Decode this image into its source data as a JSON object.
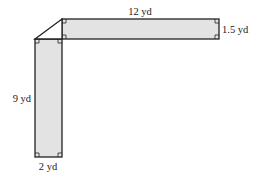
{
  "diagram": {
    "type": "L-shaped region composed of two rectangles joined by a triangle",
    "fill_color": "#e3e3e3",
    "stroke_color": "#222222",
    "labels": {
      "top_length": "12 yd",
      "right_width": "1.5 yd",
      "left_length": "9 yd",
      "bottom_width": "2 yd"
    },
    "shapes": {
      "horizontal_rect": {
        "width": "12 yd",
        "height": "1.5 yd"
      },
      "vertical_rect": {
        "width": "2 yd",
        "height": "9 yd"
      },
      "corner_triangle": {
        "legs": [
          "2 yd",
          "1.5 yd"
        ]
      }
    }
  }
}
